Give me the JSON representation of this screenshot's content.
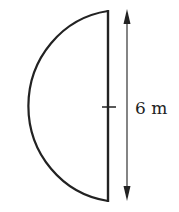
{
  "diagram": {
    "shape": "semicircle",
    "dimension_label": "6 m",
    "dimension_target": "diameter",
    "colors": {
      "stroke": "#222222",
      "arrow": "#333333",
      "background": "#ffffff"
    }
  }
}
